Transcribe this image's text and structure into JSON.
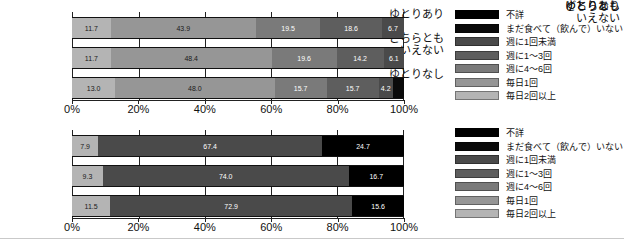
{
  "axis": {
    "ticks": [
      "0%",
      "20%",
      "40%",
      "60%",
      "80%",
      "100%"
    ],
    "values": [
      0,
      20,
      40,
      60,
      80,
      100
    ]
  },
  "categories": [
    {
      "label": "ゆとりあり",
      "lines": [
        "ゆとりあり"
      ]
    },
    {
      "label": "どちらともいえない",
      "lines": [
        "どちらとも",
        "いえない"
      ]
    },
    {
      "label": "ゆとりなし",
      "lines": [
        "ゆとりなし"
      ]
    }
  ],
  "legend": {
    "items": [
      {
        "label": "不詳",
        "color": "#000000"
      },
      {
        "label": "まだ食べて（飲んで）いない",
        "color": "#0a0a0a"
      },
      {
        "label": "週に1回未満",
        "color": "#4a4a4a"
      },
      {
        "label": "週に1〜3回",
        "color": "#5e5e5e"
      },
      {
        "label": "週に4〜6回",
        "color": "#7a7a7a"
      },
      {
        "label": "毎日1回",
        "color": "#969696"
      },
      {
        "label": "毎日2回以上",
        "color": "#b4b4b4"
      }
    ]
  },
  "chart_data": [
    {
      "id": "upper-chart",
      "type": "bar",
      "orientation": "horizontal",
      "stacked": true,
      "normalized": true,
      "title": "",
      "xlabel": "",
      "ylabel": "",
      "xlim": [
        0,
        100
      ],
      "grid": true,
      "legend_position": "right",
      "categories": [
        "ゆとりあり",
        "どちらともいえない",
        "ゆとりなし"
      ],
      "series": [
        {
          "name": "毎日2回以上",
          "color": "#b4b4b4",
          "values": [
            11.7,
            11.7,
            13.0
          ]
        },
        {
          "name": "毎日1回",
          "color": "#969696",
          "values": [
            43.9,
            48.4,
            48.0
          ]
        },
        {
          "name": "週に4〜6回",
          "color": "#7a7a7a",
          "values": [
            19.5,
            19.6,
            15.7
          ]
        },
        {
          "name": "週に1〜3回",
          "color": "#5e5e5e",
          "values": [
            18.6,
            14.2,
            15.7
          ]
        },
        {
          "name": "週に1回未満",
          "color": "#4a4a4a",
          "values": [
            6.7,
            6.1,
            4.2
          ]
        },
        {
          "name": "まだ食べて（飲んで）いない",
          "color": "#0a0a0a",
          "values": [
            0,
            0,
            3.4
          ]
        }
      ],
      "labels": [
        [
          "11.7",
          "43.9",
          "19.5",
          "18.6",
          "6.7",
          ""
        ],
        [
          "11.7",
          "48.4",
          "19.6",
          "14.2",
          "6.1",
          ""
        ],
        [
          "13.0",
          "48.0",
          "15.7",
          "15.7",
          "4.2",
          ""
        ]
      ]
    },
    {
      "id": "lower-chart",
      "type": "bar",
      "orientation": "horizontal",
      "stacked": true,
      "normalized": true,
      "title": "",
      "xlabel": "",
      "ylabel": "",
      "xlim": [
        0,
        100
      ],
      "grid": true,
      "legend_position": "right",
      "categories": [
        "ゆとりあり",
        "どちらともいえない",
        "ゆとりなし"
      ],
      "series": [
        {
          "name": "毎日2回以上",
          "color": "#b4b4b4",
          "values": [
            7.9,
            9.3,
            11.5
          ]
        },
        {
          "name": "毎日1回",
          "color": "#4a4a4a",
          "values": [
            67.4,
            74.0,
            72.9
          ]
        },
        {
          "name": "まだ食べて（飲んで）いない",
          "color": "#000000",
          "values": [
            24.7,
            16.7,
            15.6
          ]
        }
      ],
      "labels": [
        [
          "7.9",
          "67.4",
          "24.7"
        ],
        [
          "9.3",
          "74.0",
          "16.7"
        ],
        [
          "11.5",
          "72.9",
          "15.6"
        ]
      ]
    }
  ]
}
